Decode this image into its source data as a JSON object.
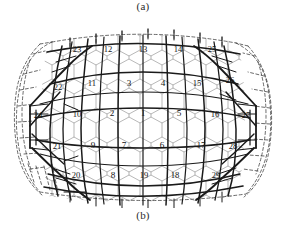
{
  "figure": {
    "caption_a": "(a)",
    "caption_b": "(b)",
    "colors": {
      "lattice": "#9a9a9a",
      "network": "#1a1a1a",
      "dashed": "#3a3a3a",
      "background": "#ffffff",
      "label": "#141414"
    },
    "faces": [
      {
        "id": "1",
        "x": 143.0,
        "y": 114.0
      },
      {
        "id": "2",
        "x": 112.0,
        "y": 114.0
      },
      {
        "id": "3",
        "x": 129.0,
        "y": 84.0
      },
      {
        "id": "4",
        "x": 163.0,
        "y": 84.0
      },
      {
        "id": "5",
        "x": 179.0,
        "y": 114.0
      },
      {
        "id": "6",
        "x": 162.0,
        "y": 146.0
      },
      {
        "id": "7",
        "x": 124.0,
        "y": 146.0
      },
      {
        "id": "8",
        "x": 113.0,
        "y": 176.0
      },
      {
        "id": "9",
        "x": 93.0,
        "y": 146.0
      },
      {
        "id": "10",
        "x": 77.0,
        "y": 115.0
      },
      {
        "id": "11",
        "x": 92.0,
        "y": 84.0
      },
      {
        "id": "12",
        "x": 108.0,
        "y": 50.0
      },
      {
        "id": "13",
        "x": 143.0,
        "y": 50.0
      },
      {
        "id": "14",
        "x": 178.0,
        "y": 50.0
      },
      {
        "id": "15",
        "x": 197.0,
        "y": 84.0
      },
      {
        "id": "16",
        "x": 215.0,
        "y": 115.0
      },
      {
        "id": "17",
        "x": 201.0,
        "y": 146.0
      },
      {
        "id": "18",
        "x": 175.0,
        "y": 176.0
      },
      {
        "id": "19",
        "x": 144.0,
        "y": 176.0
      },
      {
        "id": "20",
        "x": 76.0,
        "y": 176.0
      },
      {
        "id": "21",
        "x": 57.0,
        "y": 147.0
      },
      {
        "id": "22",
        "x": 58.0,
        "y": 88.0
      },
      {
        "id": "23",
        "x": 77.0,
        "y": 50.0
      },
      {
        "id": "24",
        "x": 38.0,
        "y": 116.0
      },
      {
        "id": "25",
        "x": 212.0,
        "y": 50.0
      },
      {
        "id": "26",
        "x": 230.0,
        "y": 81.0
      },
      {
        "id": "27",
        "x": 246.0,
        "y": 116.0
      },
      {
        "id": "28",
        "x": 233.0,
        "y": 147.0
      },
      {
        "id": "29",
        "x": 216.0,
        "y": 176.0
      }
    ]
  }
}
